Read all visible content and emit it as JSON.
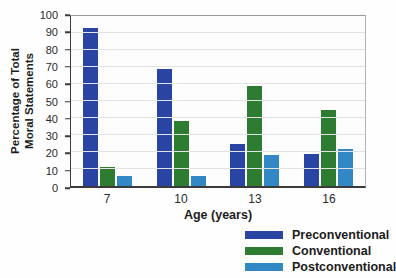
{
  "chart_data": {
    "type": "bar",
    "categories": [
      "7",
      "10",
      "13",
      "16"
    ],
    "series": [
      {
        "name": "Preconventional",
        "color": "#2a44a3",
        "values": [
          93,
          69,
          25,
          19
        ]
      },
      {
        "name": "Conventional",
        "color": "#2e7c31",
        "values": [
          11,
          38,
          59,
          45
        ]
      },
      {
        "name": "Postconventional",
        "color": "#3287c5",
        "values": [
          6,
          6,
          18,
          22
        ]
      }
    ],
    "xlabel": "Age (years)",
    "ylabel": "Percentage of Total Moral Statements",
    "ylabel_lines": [
      "Percentage of Total",
      "Moral Statements"
    ],
    "ylim": [
      0,
      100
    ],
    "yticks": [
      0,
      10,
      20,
      30,
      40,
      50,
      60,
      70,
      80,
      90,
      100
    ],
    "grid": "horizontal",
    "legend_position": "below-right"
  }
}
